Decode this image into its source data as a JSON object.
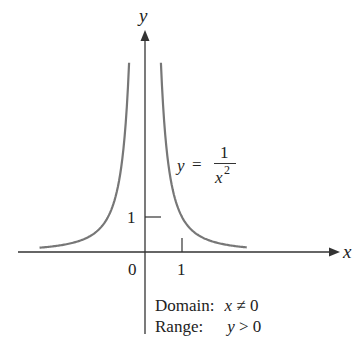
{
  "chart_data": {
    "type": "line",
    "title": "",
    "function": "y = 1/x^2",
    "xlabel": "x",
    "ylabel": "y",
    "x_ticks": [
      {
        "value": 0,
        "label": "0"
      },
      {
        "value": 1,
        "label": "1"
      }
    ],
    "y_ticks": [
      {
        "value": 1,
        "label": "1"
      }
    ],
    "xlim": [
      -3.9,
      5.0
    ],
    "ylim": [
      -2.7,
      7.0
    ],
    "grid": false,
    "series": [
      {
        "name": "left branch",
        "x": [
          -2.85,
          -2,
          -1.5,
          -1,
          -0.75,
          -0.5,
          -0.43
        ],
        "y": [
          0.12,
          0.25,
          0.44,
          1.0,
          1.78,
          4.0,
          5.7
        ]
      },
      {
        "name": "right branch",
        "x": [
          0.43,
          0.5,
          0.75,
          1,
          1.5,
          2,
          2.75
        ],
        "y": [
          5.7,
          4.0,
          1.78,
          1.0,
          0.44,
          0.25,
          0.13
        ]
      }
    ],
    "curve_color": "#777777",
    "annotations": [
      "y = 1/x²",
      "Domain: x ≠ 0",
      "Range: y > 0"
    ]
  },
  "labels": {
    "y_axis": "y",
    "x_axis": "x",
    "origin": "0",
    "x_tick_1": "1",
    "y_tick_1": "1",
    "eq_lhs": "y",
    "eq_eq": "=",
    "eq_num": "1",
    "eq_den_base": "x",
    "eq_den_exp": "2",
    "domain_label": "Domain:",
    "domain_value_var": "x",
    "domain_value_rest": " ≠ 0",
    "range_label": "Range:",
    "range_value_var": "y",
    "range_value_rest": " > 0"
  }
}
